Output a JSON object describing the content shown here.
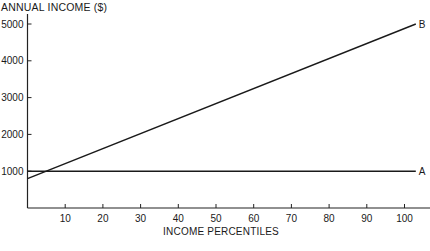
{
  "chart_data": {
    "type": "line",
    "title": "",
    "ylabel": "ANNUAL INCOME ($)",
    "xlabel": "INCOME PERCENTILES",
    "xlim": [
      0,
      105
    ],
    "ylim": [
      0,
      5200
    ],
    "x_ticks": [
      10,
      20,
      30,
      40,
      50,
      60,
      70,
      80,
      90,
      100
    ],
    "y_ticks": [
      1000,
      2000,
      3000,
      4000,
      5000
    ],
    "grid": false,
    "legend": "inline end-of-line labels",
    "series": [
      {
        "name": "A",
        "x": [
          0,
          103
        ],
        "y": [
          1000,
          1000
        ]
      },
      {
        "name": "B",
        "x": [
          0,
          103
        ],
        "y": [
          800,
          5000
        ]
      }
    ]
  },
  "labels": {
    "ylabel": "ANNUAL INCOME ($)",
    "xlabel": "INCOME PERCENTILES"
  }
}
